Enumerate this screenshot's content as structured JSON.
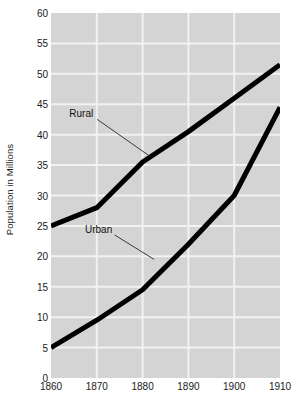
{
  "chart_data": {
    "type": "line",
    "title": "",
    "xlabel": "",
    "ylabel": "Population in Millions",
    "x": [
      1860,
      1870,
      1880,
      1890,
      1900,
      1910
    ],
    "xtick_labels": [
      "1860",
      "1870",
      "1880",
      "1890",
      "1900",
      "1910"
    ],
    "xlim": [
      1860,
      1910
    ],
    "ylim": [
      0,
      60
    ],
    "ytick_labels": [
      "0",
      "5",
      "10",
      "15",
      "20",
      "25",
      "30",
      "35",
      "40",
      "45",
      "50",
      "55",
      "60"
    ],
    "yticks": [
      0,
      5,
      10,
      15,
      20,
      25,
      30,
      35,
      40,
      45,
      50,
      55,
      60
    ],
    "grid": true,
    "grid_color": "#f2f2f2",
    "plot_background": "#d4d4d4",
    "line_color": "#000000",
    "legend_position": "inline-annotations",
    "series": [
      {
        "name": "Rural",
        "label": "Rural",
        "values": [
          25,
          28,
          35.5,
          40.5,
          46,
          51.5
        ],
        "annotation": {
          "text_x": 1866.6,
          "text_y": 43.5,
          "leader_to_x": 1881.5,
          "leader_to_y": 36.5
        }
      },
      {
        "name": "Urban",
        "label": "Urban",
        "values": [
          5,
          9.5,
          14.5,
          22,
          30,
          44.5
        ],
        "annotation": {
          "text_x": 1870.4,
          "text_y": 24.5,
          "leader_to_x": 1882.5,
          "leader_to_y": 19.5
        }
      }
    ]
  }
}
